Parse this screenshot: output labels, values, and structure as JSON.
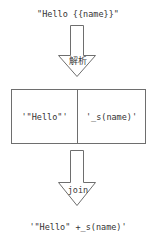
{
  "diagram": {
    "background_color": "#ffffff",
    "stroke_color": "#6e6e6e",
    "text_color": "#333333",
    "top_expression": "\"Hello {{name}}\"",
    "bottom_expression": "'\"Hello\" +_s(name)'",
    "arrows": [
      {
        "name": "parse-arrow",
        "direction": "down",
        "label": "解析"
      },
      {
        "name": "join-arrow",
        "direction": "down",
        "label": "join"
      }
    ],
    "token_box": {
      "cells": [
        {
          "value": "'\"Hello\"'"
        },
        {
          "value": "'_s(name)'"
        }
      ]
    }
  }
}
